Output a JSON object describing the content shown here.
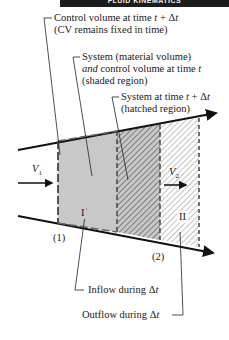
{
  "header": {
    "title": "FLUID KINEMATICS"
  },
  "labels": {
    "cv_line1_pre": "Control volume at time ",
    "cv_line1_var": "t",
    "cv_line1_post": " + Δ",
    "cv_line1_var2": "t",
    "cv_line2": "(CV remains fixed in time)",
    "sys_line1": "System (material volume)",
    "sys_line2_it": "and",
    "sys_line2_post": " control volume at time ",
    "sys_line2_var": "t",
    "sys_line3": "(shaded region)",
    "sys2_line1_pre": "System at time ",
    "sys2_line1_var": "t",
    "sys2_line1_post": " + Δ",
    "sys2_line1_var2": "t",
    "sys2_line2": "(hatched region)",
    "v1_main": "V",
    "v1_sub": "1",
    "v2_main": "V",
    "v2_sub": "2",
    "region_one": "I",
    "region_two": "II",
    "section_one": "(1)",
    "section_two": "(2)",
    "inflow_pre": "Inflow during Δ",
    "inflow_var": "t",
    "outflow_pre": "Outflow during Δ",
    "outflow_var": "t"
  },
  "colors": {
    "shaded": "#c8c8c8",
    "line": "#111111",
    "header_bg": "#1c1c1c"
  }
}
